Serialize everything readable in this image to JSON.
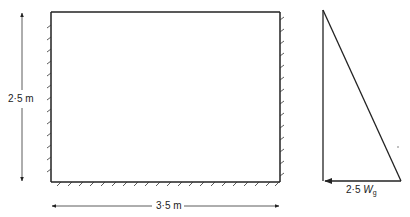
{
  "diagram": {
    "wall": {
      "width_label": "3·5 m",
      "height_label": "2·5 m",
      "fixed_edges": [
        "left",
        "right",
        "bottom"
      ],
      "free_edge": "top"
    },
    "pressure_distribution": {
      "shape": "triangle",
      "base_label_value": "2·5",
      "base_label_symbol": "W",
      "base_label_subscript": "g"
    }
  }
}
